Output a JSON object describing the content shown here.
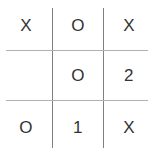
{
  "widget": {
    "name": "tic-tac-toe-grid",
    "title": "Tic Tac Toe Grid",
    "background_color": "#ffffff",
    "text_color": "#333333",
    "vertical_line_color": "#808080",
    "horizontal_line_color": "#b0b0b0",
    "rows": 3,
    "columns": 3
  },
  "grid": {
    "cells": [
      [
        {
          "value": "X",
          "empty": false
        },
        {
          "value": "O",
          "empty": false
        },
        {
          "value": "X",
          "empty": false
        }
      ],
      [
        {
          "value": "",
          "empty": true
        },
        {
          "value": "O",
          "empty": false
        },
        {
          "value": "2",
          "empty": false
        }
      ],
      [
        {
          "value": "O",
          "empty": false
        },
        {
          "value": "1",
          "empty": false
        },
        {
          "value": "X",
          "empty": false
        }
      ]
    ]
  }
}
